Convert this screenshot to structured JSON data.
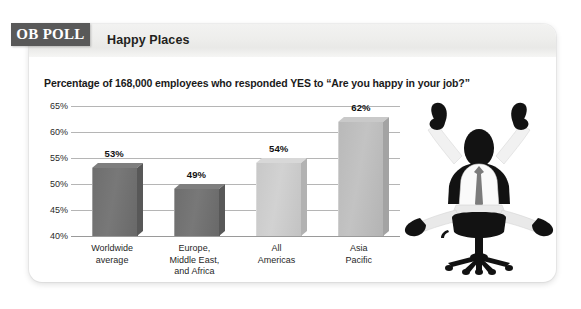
{
  "badge": {
    "label": "OB POLL"
  },
  "header": {
    "title": "Happy Places"
  },
  "chart_subtitle": "Percentage of 168,000 employees who responded YES to “Are you happy in your job?”",
  "illustration": {
    "name": "happy-employee-in-office-chair",
    "description": "Silhouette of a businessman sitting in an office chair with both arms raised in celebration"
  },
  "colors": {
    "badge_background": "#595959",
    "header_band": "#eeeeec",
    "gridline": "#b5b5b5",
    "bar_1": "#6e6e6e",
    "bar_2": "#6e6e6e",
    "bar_3": "#c8c8c8",
    "bar_4": "#b9b9b9"
  },
  "chart_data": {
    "type": "bar",
    "title": "Happy Places",
    "subtitle": "Percentage of 168,000 employees who responded YES to “Are you happy in your job?”",
    "categories": [
      "Worldwide average",
      "Europe, Middle East, and Africa",
      "All Americas",
      "Asia Pacific"
    ],
    "category_lines": [
      [
        "Worldwide",
        "average"
      ],
      [
        "Europe,",
        "Middle East,",
        "and Africa"
      ],
      [
        "All",
        "Americas"
      ],
      [
        "Asia",
        "Pacific"
      ]
    ],
    "values": [
      53,
      49,
      54,
      62
    ],
    "value_labels": [
      "53%",
      "49%",
      "54%",
      "62%"
    ],
    "bar_colors": [
      "#6e6e6e",
      "#6e6e6e",
      "#c8c8c8",
      "#b9b9b9"
    ],
    "xlabel": "",
    "ylabel": "",
    "ylim": [
      40,
      65
    ],
    "yticks": [
      65,
      60,
      55,
      50,
      45,
      40
    ],
    "ytick_labels": [
      "65%",
      "60%",
      "55%",
      "50%",
      "45%",
      "40%"
    ],
    "grid": true,
    "legend": false
  }
}
